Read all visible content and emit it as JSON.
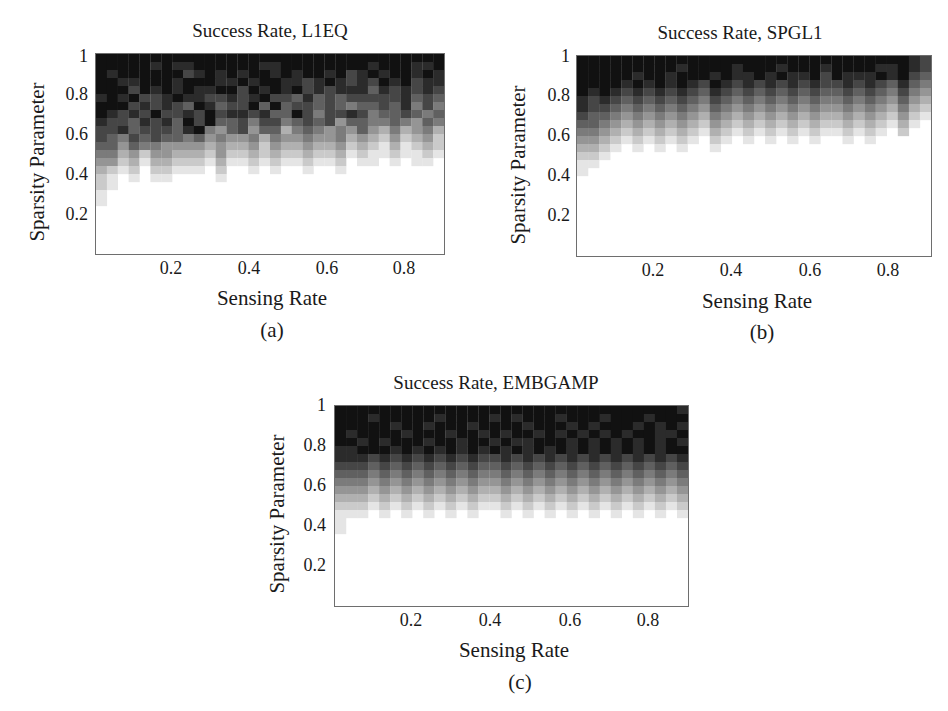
{
  "figure": {
    "panels": [
      {
        "id": "a",
        "title": "Success Rate, L1EQ",
        "xlabel": "Sensing Rate",
        "ylabel": "Sparsity Parameter",
        "caption": "(a)"
      },
      {
        "id": "b",
        "title": "Success Rate, SPGL1",
        "xlabel": "Sensing Rate",
        "ylabel": "Sparsity Parameter",
        "caption": "(b)"
      },
      {
        "id": "c",
        "title": "Success Rate, EMBGAMP",
        "xlabel": "Sensing Rate",
        "ylabel": "Sparsity Parameter",
        "caption": "(c)"
      }
    ],
    "xticks": [
      "0.2",
      "0.4",
      "0.6",
      "0.8"
    ],
    "yticks": [
      "1",
      "0.8",
      "0.6",
      "0.4",
      "0.2"
    ]
  },
  "chart_data": [
    {
      "type": "heatmap",
      "title": "Success Rate, L1EQ",
      "xlabel": "Sensing Rate",
      "ylabel": "Sparsity Parameter",
      "caption": "(a)",
      "xlim": [
        0.0,
        0.9
      ],
      "ylim": [
        0.0,
        1.0
      ],
      "xticks": [
        0.2,
        0.4,
        0.6,
        0.8
      ],
      "yticks": [
        0.2,
        0.4,
        0.6,
        0.8,
        1.0
      ],
      "colormap": "gray (black = high success, white = low)",
      "encoding": "rows top (sparsity≈1) to bottom (sparsity≈0); each char = gray level 0 (white) .. 9 (black)",
      "grid": [
        "99999999999999999999999999999999",
        "99999898899999988999999998999889",
        "98999999789898998989989789899898",
        "99889998999889899887898787989788",
        "99979898988997989897878886878787",
        "89897789887787897768676777778676",
        "99978787698677969677676566768575",
        "98787977879788786697577875667656",
        "87768786979667577567674665565465",
        "77867776895467466356545464353453",
        "76576766564544535445445343242342",
        "66465544443433424334334232131232",
        "55342443332422323223223121121121",
        "44231332221311212112112011010110",
        "32120221110200101001001000000000",
        "21010110000100000000000000000000",
        "21000000000000000000000000000000",
        "10000000000000000000000000000000",
        "10000000000000000000000000000000",
        "00000000000000000000000000000000",
        "00000000000000000000000000000000",
        "00000000000000000000000000000000",
        "00000000000000000000000000000000",
        "00000000000000000000000000000000",
        "00000000000000000000000000000000"
      ]
    },
    {
      "type": "heatmap",
      "title": "Success Rate, SPGL1",
      "xlabel": "Sensing Rate",
      "ylabel": "Sparsity Parameter",
      "caption": "(b)",
      "xlim": [
        0.0,
        0.9
      ],
      "ylim": [
        0.0,
        1.0
      ],
      "xticks": [
        0.2,
        0.4,
        0.6,
        0.8
      ],
      "yticks": [
        0.2,
        0.4,
        0.6,
        0.8,
        1.0
      ],
      "colormap": "gray (black = high success, white = low)",
      "encoding": "rows top (sparsity≈1) to bottom (sparsity≈0); each char = gray level 0 (white) .. 9 (black)",
      "grid": [
        "99999999999999999999999999999987",
        "99999999989999899989998999988987",
        "99999899899989889898897988898976",
        "99998989898798787878787787876865",
        "98987878787687676767676676765754",
        "87876767676576565656565565654643",
        "87765656565465454545454454543532",
        "76654545454354343434343343432421",
        "66543434343243232323232232321310",
        "55432323232132121212121121210200",
        "44321212121021010101010010100000",
        "33210101010010000000000000000000",
        "22100000000000000000000000000000",
        "11000000000000000000000000000000",
        "10000000000000000000000000000000",
        "00000000000000000000000000000000",
        "00000000000000000000000000000000",
        "00000000000000000000000000000000",
        "00000000000000000000000000000000",
        "00000000000000000000000000000000",
        "00000000000000000000000000000000",
        "00000000000000000000000000000000",
        "00000000000000000000000000000000",
        "00000000000000000000000000000000",
        "00000000000000000000000000000000"
      ]
    },
    {
      "type": "heatmap",
      "title": "Success Rate, EMBGAMP",
      "xlabel": "Sensing Rate",
      "ylabel": "Sparsity Parameter",
      "caption": "(c)",
      "xlim": [
        0.0,
        0.9
      ],
      "ylim": [
        0.0,
        1.0
      ],
      "xticks": [
        0.2,
        0.4,
        0.6,
        0.8
      ],
      "yticks": [
        0.2,
        0.4,
        0.6,
        0.8,
        1.0
      ],
      "colormap": "gray (black = high success, white = low)",
      "encoding": "rows top (sparsity≈1) to bottom (sparsity≈0); each char = gray level 0 (white) .. 9 (black)",
      "grid": [
        "99999999999999999999999999999998",
        "99989999989999898999899989998999",
        "99999899899989999899989899989898",
        "98999989998998989989898989899889",
        "99898999899899898899989898989898",
        "88999898989898989898989898989899",
        "88878787878787787878787878787878",
        "77767676767676676767676767676767",
        "66656565656565565656565656565656",
        "55545454545454454545454545454545",
        "44434343434343343434343434343434",
        "33323232323232232323232323232323",
        "22212121212121121212121212121212",
        "11101010101010010101010101010101",
        "10000000000000000000000000000000",
        "10000000000000000000000000000000",
        "00000000000000000000000000000000",
        "00000000000000000000000000000000",
        "00000000000000000000000000000000",
        "00000000000000000000000000000000",
        "00000000000000000000000000000000",
        "00000000000000000000000000000000",
        "00000000000000000000000000000000",
        "00000000000000000000000000000000",
        "00000000000000000000000000000000"
      ]
    }
  ]
}
